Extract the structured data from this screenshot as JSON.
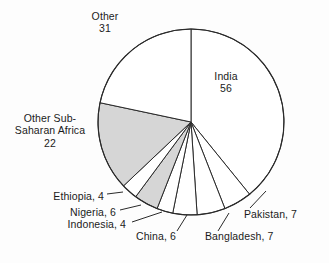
{
  "chart_data": {
    "type": "pie",
    "title": "",
    "subtitle": "",
    "units": "millions",
    "total": 143,
    "start_angle_deg": 0,
    "direction": "clockwise",
    "legend": "none",
    "grid": false,
    "categories": [
      "India",
      "Pakistan",
      "Bangladesh",
      "China",
      "Indonesia",
      "Nigeria",
      "Ethiopia",
      "Other Sub-Saharan Africa",
      "Other"
    ],
    "values": [
      56,
      7,
      7,
      6,
      4,
      6,
      4,
      22,
      31
    ],
    "slice_fills": [
      "#ffffff",
      "#ffffff",
      "#ffffff",
      "#ffffff",
      "#ffffff",
      "#d6d6d6",
      "#ffffff",
      "#d6d6d6",
      "#ffffff"
    ],
    "slices": [
      {
        "name": "India",
        "value": 56,
        "shaded": false
      },
      {
        "name": "Pakistan",
        "value": 7,
        "shaded": false
      },
      {
        "name": "Bangladesh",
        "value": 7,
        "shaded": false
      },
      {
        "name": "China",
        "value": 6,
        "shaded": false
      },
      {
        "name": "Indonesia",
        "value": 4,
        "shaded": false
      },
      {
        "name": "Nigeria",
        "value": 6,
        "shaded": true
      },
      {
        "name": "Ethiopia",
        "value": 4,
        "shaded": false
      },
      {
        "name": "Other Sub-Saharan Africa",
        "value": 22,
        "shaded": true
      },
      {
        "name": "Other",
        "value": 31,
        "shaded": false
      }
    ]
  },
  "labels": {
    "other": "Other\n31",
    "india": "India\n56",
    "ossa": "Other Sub-\nSaharan Africa\n22",
    "ethiopia": "Ethiopia, 4",
    "nigeria": "Nigeria, 6",
    "indonesia": "Indonesia, 4",
    "china": "China, 6",
    "bangladesh": "Bangladesh, 7",
    "pakistan": "Pakistan, 7"
  },
  "style": {
    "background": "#fdfdfd",
    "stroke": "#2a2a2a",
    "shaded_fill": "#d6d6d6",
    "plain_fill": "#ffffff",
    "text_color": "#1b1b1b"
  }
}
